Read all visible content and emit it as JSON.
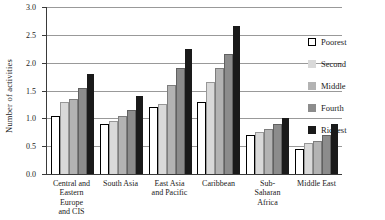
{
  "figure": {
    "background": "#ffffff",
    "gridline_color": "#999999",
    "axis_color": "#3a3a3a"
  },
  "chart_data": {
    "type": "bar",
    "title": "",
    "xlabel": "",
    "ylabel": "Number of activities",
    "ylim": [
      0,
      3.0
    ],
    "yticks": [
      0.0,
      0.5,
      1.0,
      1.5,
      2.0,
      2.5,
      3.0
    ],
    "ytick_labels": [
      "0.0",
      "0.5",
      "1.0",
      "1.5",
      "2.0",
      "2.5",
      "3.0"
    ],
    "grid": true,
    "legend_position": "right",
    "categories": [
      "Central and Eastern Europe and CIS",
      "South Asia",
      "East Asia and Pacific",
      "Caribbean",
      "Sub-Saharan Africa",
      "Middle East"
    ],
    "category_label_lines": [
      [
        "Central and",
        "Eastern Europe",
        "and CIS"
      ],
      [
        "South Asia"
      ],
      [
        "East Asia",
        "and Pacific"
      ],
      [
        "Caribbean"
      ],
      [
        "Sub-",
        "Saharan",
        "Africa"
      ],
      [
        "Middle East"
      ]
    ],
    "series": [
      {
        "name": "Poorest",
        "color": "#ffffff",
        "values": [
          1.05,
          0.9,
          1.2,
          1.3,
          0.7,
          0.45
        ]
      },
      {
        "name": "Second",
        "color": "#d9d9d9",
        "values": [
          1.3,
          0.95,
          1.25,
          1.65,
          0.75,
          0.55
        ]
      },
      {
        "name": "Middle",
        "color": "#b3b3b3",
        "values": [
          1.35,
          1.05,
          1.6,
          1.9,
          0.8,
          0.6
        ]
      },
      {
        "name": "Fourth",
        "color": "#8c8c8c",
        "values": [
          1.55,
          1.15,
          1.9,
          2.15,
          0.9,
          0.7
        ]
      },
      {
        "name": "Richest",
        "color": "#1a1a1a",
        "values": [
          1.8,
          1.4,
          2.25,
          2.65,
          1.0,
          0.9
        ]
      }
    ]
  }
}
